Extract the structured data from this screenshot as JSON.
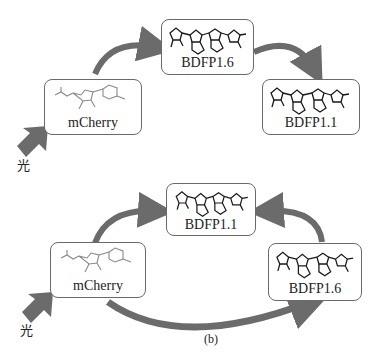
{
  "diagram_a": {
    "top_box": {
      "label": "BDFP1.6"
    },
    "left_box": {
      "label": "mCherry"
    },
    "right_box": {
      "label": "BDFP1.1"
    },
    "light_label": "光"
  },
  "diagram_b": {
    "top_box": {
      "label": "BDFP1.1"
    },
    "left_box": {
      "label": "mCherry"
    },
    "right_box": {
      "label": "BDFP1.6"
    },
    "light_label": "光",
    "caption": "(b)"
  },
  "colors": {
    "arrow": "#6b6b6b",
    "box_border": "#6a6a6a",
    "structure": "#1a1a1a",
    "mcherry_structure": "#8a8a8a"
  }
}
